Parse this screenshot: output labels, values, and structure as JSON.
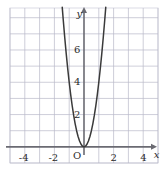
{
  "figure": {
    "name": "parabola-graph",
    "background_color": "#ffffff",
    "grid_color": "#b9b9c9",
    "grid_minor_color": "#dcdce6",
    "axis_color": "#6a6a72",
    "curve_color": "#3a3a3a",
    "text_color": "#2b2b2b"
  },
  "axis_labels": {
    "x": "x",
    "y": "y",
    "origin": "O"
  },
  "x_ticks": [
    {
      "value": -4,
      "label": "-4"
    },
    {
      "value": -2,
      "label": "-2"
    },
    {
      "value": 2,
      "label": "2"
    },
    {
      "value": 4,
      "label": "4"
    }
  ],
  "y_ticks": [
    {
      "value": 2,
      "label": "2"
    },
    {
      "value": 4,
      "label": "4"
    },
    {
      "value": 6,
      "label": "6"
    }
  ],
  "chart_data": {
    "type": "line",
    "title": "",
    "subtitle": "",
    "xlabel": "x",
    "ylabel": "y",
    "xlim": [
      -5,
      5
    ],
    "ylim": [
      -1,
      8.6
    ],
    "grid": true,
    "grid_step_x": 1,
    "grid_step_y": 1,
    "legend": false,
    "legend_position": "none",
    "annotations": [
      {
        "text": "O",
        "x": -0.32,
        "y": -0.45,
        "role": "origin-label"
      },
      {
        "text": "x",
        "x": 4.75,
        "y": -0.42,
        "role": "x-axis-name"
      },
      {
        "text": "y",
        "x": -0.35,
        "y": 8.35,
        "role": "y-axis-name"
      }
    ],
    "series": [
      {
        "name": "y = 4x^2",
        "equation": "y = 4x^2",
        "color": "#3a3a3a",
        "vertex": [
          0,
          0
        ],
        "x": [
          -1.47,
          -1.4,
          -1.3,
          -1.2,
          -1.1,
          -1.0,
          -0.9,
          -0.8,
          -0.7,
          -0.6,
          -0.5,
          -0.4,
          -0.3,
          -0.2,
          -0.1,
          0,
          0.1,
          0.2,
          0.3,
          0.4,
          0.5,
          0.6,
          0.7,
          0.8,
          0.9,
          1.0,
          1.1,
          1.2,
          1.3,
          1.4,
          1.47
        ],
        "values": [
          8.64,
          7.84,
          6.76,
          5.76,
          4.84,
          4.0,
          3.24,
          2.56,
          1.96,
          1.44,
          1.0,
          0.64,
          0.36,
          0.16,
          0.04,
          0,
          0.04,
          0.16,
          0.36,
          0.64,
          1.0,
          1.44,
          1.96,
          2.56,
          3.24,
          4.0,
          4.84,
          5.76,
          6.76,
          7.84,
          8.64
        ]
      }
    ]
  }
}
